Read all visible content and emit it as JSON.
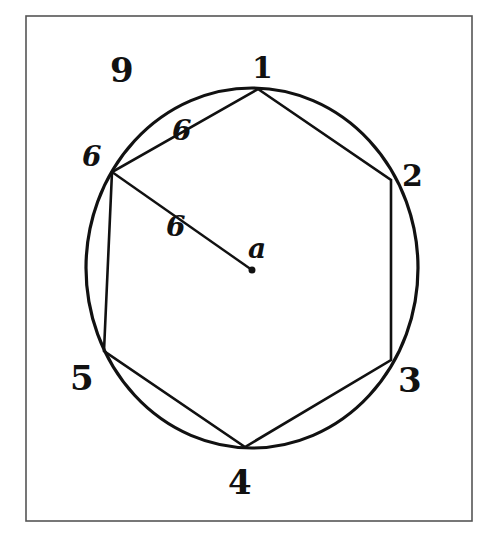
{
  "figure": {
    "frame": {
      "x": 26,
      "y": 16,
      "width": 446,
      "height": 505,
      "stroke": "#555555"
    },
    "circle": {
      "cx": 252,
      "cy": 268,
      "rx": 166,
      "ry": 180,
      "stroke": "#111111"
    },
    "center": {
      "x": 252,
      "y": 270,
      "label": "a"
    },
    "hexagon": {
      "vertices": [
        {
          "id": "1",
          "x": 258,
          "y": 89
        },
        {
          "id": "2",
          "x": 391,
          "y": 180
        },
        {
          "id": "3",
          "x": 391,
          "y": 360
        },
        {
          "id": "4",
          "x": 245,
          "y": 447
        },
        {
          "id": "5",
          "x": 104,
          "y": 351
        },
        {
          "id": "6",
          "x": 112,
          "y": 172
        }
      ]
    },
    "labels": {
      "figure_number": "9",
      "vertex_1": "1",
      "vertex_2": "2",
      "vertex_3": "3",
      "vertex_4": "4",
      "vertex_5": "5",
      "vertex_6": "6",
      "chord_length": "6",
      "radius_length": "6",
      "center": "a"
    }
  }
}
